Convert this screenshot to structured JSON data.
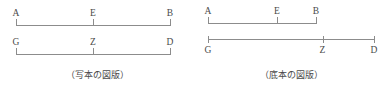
{
  "figure": {
    "name": "line-segment-comparison",
    "background_color": "#ffffff",
    "line_color": "#8c8c8c",
    "text_color": "#4a4a4a",
    "panels": [
      {
        "id": "manuscript",
        "caption": "（写本の図版）",
        "segments": [
          {
            "id": "segment-aeb",
            "label_position": "above",
            "points": [
              {
                "label": "A",
                "pos_pct": 0
              },
              {
                "label": "E",
                "pos_pct": 50
              },
              {
                "label": "B",
                "pos_pct": 100
              }
            ]
          },
          {
            "id": "segment-gzd",
            "label_position": "above",
            "points": [
              {
                "label": "G",
                "pos_pct": 0
              },
              {
                "label": "Z",
                "pos_pct": 50
              },
              {
                "label": "D",
                "pos_pct": 100
              }
            ]
          }
        ]
      },
      {
        "id": "basetext",
        "caption": "（底本の図版）",
        "segments": [
          {
            "id": "segment-aeb",
            "label_position": "above",
            "points": [
              {
                "label": "A",
                "pos_pct": 0
              },
              {
                "label": "E",
                "pos_pct": 64
              },
              {
                "label": "B",
                "pos_pct": 100
              }
            ]
          },
          {
            "id": "segment-gzd",
            "label_position": "below",
            "points": [
              {
                "label": "G",
                "pos_pct": 0
              },
              {
                "label": "Z",
                "pos_pct": 69
              },
              {
                "label": "D",
                "pos_pct": 100
              }
            ]
          }
        ]
      }
    ]
  }
}
